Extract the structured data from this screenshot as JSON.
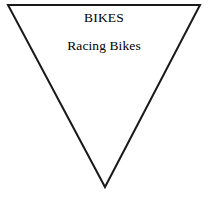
{
  "canvas": {
    "width": 208,
    "height": 200,
    "background_color": "#ffffff"
  },
  "diagram": {
    "shape_name": "inverted-triangle",
    "stroke_color": "#1a1a1a",
    "stroke_width": 2,
    "fill_color": "none",
    "points": "8,5 200,5 105,187",
    "vertices": [
      {
        "label": "top-left",
        "x": 8,
        "y": 5
      },
      {
        "label": "top-right",
        "x": 200,
        "y": 5
      },
      {
        "label": "bottom-apex",
        "x": 105,
        "y": 187
      }
    ]
  },
  "labels": {
    "title": "BIKES",
    "subtitle": "Racing Bikes"
  }
}
